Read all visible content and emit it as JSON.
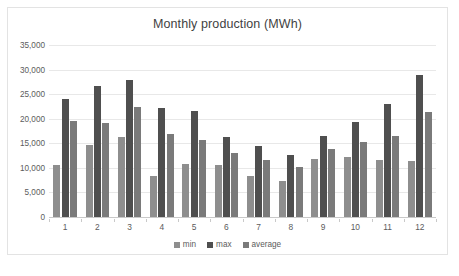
{
  "chart_data": {
    "type": "bar",
    "title": "Monthly production (MWh)",
    "xlabel": "",
    "ylabel": "",
    "ylim": [
      0,
      35000
    ],
    "ytick_step": 5000,
    "yticks": [
      0,
      5000,
      10000,
      15000,
      20000,
      25000,
      30000,
      35000
    ],
    "ytick_labels": [
      "0",
      "5,000",
      "10,000",
      "15,000",
      "20,000",
      "25,000",
      "30,000",
      "35,000"
    ],
    "categories": [
      "1",
      "2",
      "3",
      "4",
      "5",
      "6",
      "7",
      "8",
      "9",
      "10",
      "11",
      "12"
    ],
    "grid": true,
    "legend_position": "bottom",
    "series": [
      {
        "name": "min",
        "color": "#8e8e8e",
        "values": [
          10500,
          14600,
          16200,
          8400,
          10800,
          10600,
          8400,
          7300,
          11900,
          12200,
          11700,
          11500
        ]
      },
      {
        "name": "max",
        "color": "#4f4f4f",
        "values": [
          24100,
          26600,
          27900,
          22100,
          21500,
          16200,
          14500,
          12600,
          16500,
          19300,
          22900,
          29000
        ]
      },
      {
        "name": "average",
        "color": "#7a7a7a",
        "values": [
          19500,
          19100,
          22300,
          16900,
          15600,
          13100,
          11700,
          10200,
          13800,
          15300,
          16500,
          21300
        ]
      }
    ]
  },
  "legend": {
    "items": [
      {
        "label": "min"
      },
      {
        "label": "max"
      },
      {
        "label": "average"
      }
    ]
  },
  "colors": {
    "min": "#8e8e8e",
    "max": "#4f4f4f",
    "average": "#7a7a7a",
    "grid": "#e8e8e8",
    "text": "#5c5c5c",
    "title": "#3f3f3f",
    "frame": "#e3e3e3",
    "background": "#ffffff"
  }
}
